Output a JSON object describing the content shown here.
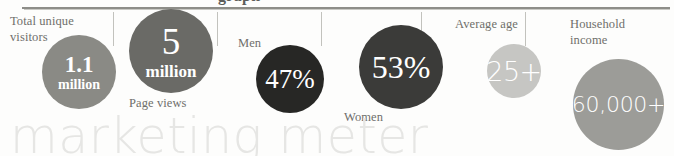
{
  "heading_fragment": "graph",
  "watermark": "marketing meter",
  "colors": {
    "rule": "#8d8d88",
    "divider": "#c2c2bd",
    "label_text": "#6f6f6b",
    "watermark": "#e6e6e4",
    "circle_visitors": "#8a8a85",
    "circle_pageviews": "#6a6a66",
    "circle_men": "#272725",
    "circle_women": "#3b3b39",
    "circle_age": "#c6c6c3",
    "circle_income": "#9c9c98",
    "value_text": "#ffffff"
  },
  "metrics": [
    {
      "id": "visitors",
      "label": "Total unique\nvisitors",
      "value_primary": "1.1",
      "value_secondary": "million",
      "label_position": "top-left"
    },
    {
      "id": "pageviews",
      "label": "Page views",
      "value_primary": "5",
      "value_secondary": "million",
      "label_position": "bottom"
    },
    {
      "id": "men",
      "label": "Men",
      "value_primary": "47%",
      "value_secondary": "",
      "label_position": "top-left"
    },
    {
      "id": "women",
      "label": "Women",
      "value_primary": "53%",
      "value_secondary": "",
      "label_position": "bottom-left"
    },
    {
      "id": "age",
      "label": "Average age",
      "value_primary": "25+",
      "value_secondary": "",
      "label_position": "top"
    },
    {
      "id": "income",
      "label": "Household\nincome",
      "value_primary": "60,000+",
      "value_secondary": "",
      "label_position": "top"
    }
  ]
}
